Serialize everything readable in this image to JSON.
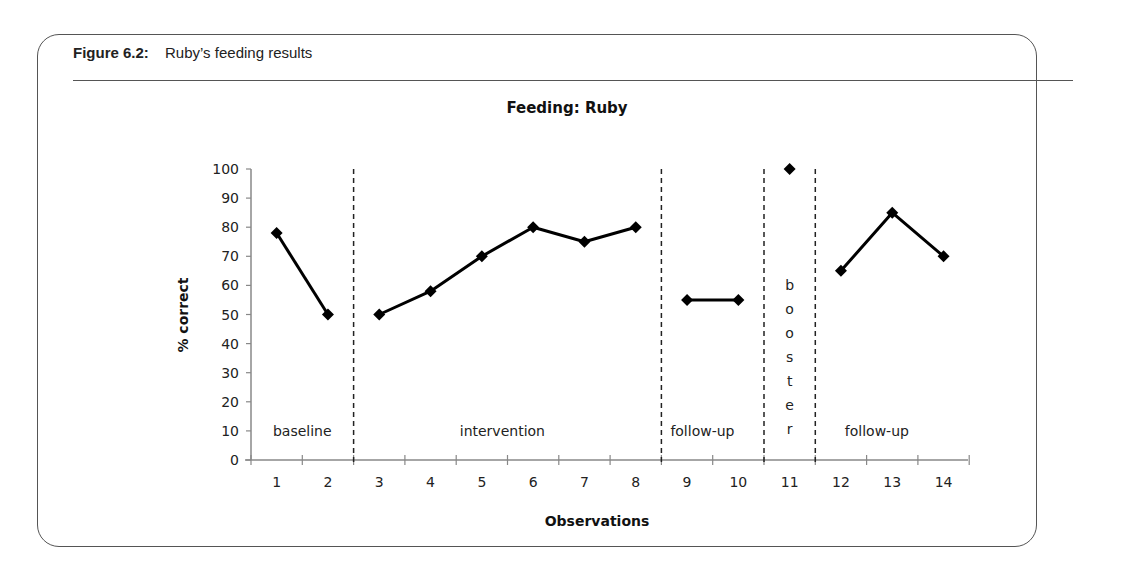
{
  "figure": {
    "number_label": "Figure 6.2:",
    "caption": "Ruby’s feeding results"
  },
  "chart_data": {
    "type": "line",
    "title": "Feeding: Ruby",
    "xlabel": "Observations",
    "ylabel": "% correct",
    "ylim": [
      0,
      100
    ],
    "yticks": [
      0,
      10,
      20,
      30,
      40,
      50,
      60,
      70,
      80,
      90,
      100
    ],
    "categories": [
      "1",
      "2",
      "3",
      "4",
      "5",
      "6",
      "7",
      "8",
      "9",
      "10",
      "11",
      "12",
      "13",
      "14"
    ],
    "grid": false,
    "legend": null,
    "marker": "diamond",
    "series": [
      {
        "name": "baseline",
        "x": [
          1,
          2
        ],
        "values": [
          78,
          50
        ]
      },
      {
        "name": "intervention",
        "x": [
          3,
          4,
          5,
          6,
          7,
          8
        ],
        "values": [
          50,
          58,
          70,
          80,
          75,
          80
        ]
      },
      {
        "name": "follow-up",
        "x": [
          9,
          10
        ],
        "values": [
          55,
          55
        ]
      },
      {
        "name": "booster",
        "x": [
          11
        ],
        "values": [
          100
        ]
      },
      {
        "name": "follow-up",
        "x": [
          12,
          13,
          14
        ],
        "values": [
          65,
          85,
          70
        ]
      }
    ],
    "phase_lines": [
      2.5,
      8.5,
      10.5,
      11.5
    ],
    "phase_labels": [
      {
        "text": "baseline",
        "x_center": 1.5,
        "y": 10
      },
      {
        "text": "intervention",
        "x_center": 5.4,
        "y": 10
      },
      {
        "text": "follow-up",
        "x_center": 9.3,
        "y": 10
      },
      {
        "text": "booster",
        "x_center": 11,
        "orientation": "vertical"
      },
      {
        "text": "follow-up",
        "x_center": 12.7,
        "y": 10
      }
    ]
  }
}
